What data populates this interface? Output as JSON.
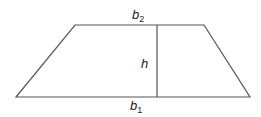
{
  "diagram": {
    "type": "trapezoid",
    "stroke_color": "#555555",
    "labels": {
      "top_base": {
        "main": "b",
        "sub": "2"
      },
      "bottom_base": {
        "main": "b",
        "sub": "1"
      },
      "height": {
        "main": "h"
      }
    }
  }
}
